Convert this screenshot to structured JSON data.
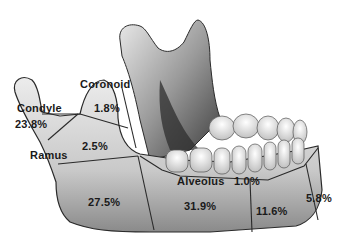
{
  "diagram": {
    "regions": [
      {
        "name": "Condyle",
        "label": "Condyle",
        "value": "23.8%"
      },
      {
        "name": "Coronoid",
        "label": "Coronoid",
        "value": "1.8%"
      },
      {
        "name": "Ramus",
        "label": "Ramus",
        "value": "2.5%"
      },
      {
        "name": "Angle",
        "label": "",
        "value": "27.5%"
      },
      {
        "name": "Body",
        "label": "",
        "value": "31.9%"
      },
      {
        "name": "Alveolus",
        "label": "Alveolus",
        "value": "1.0%"
      },
      {
        "name": "Parasymphysis",
        "label": "",
        "value": "11.6%"
      },
      {
        "name": "Symphysis",
        "label": "",
        "value": "5.8%"
      }
    ]
  },
  "colors": {
    "background": "#ffffff",
    "bone_light": "#e4e4e4",
    "bone_mid": "#b5b5b5",
    "bone_dark": "#3a3a3a",
    "divider": "#2a2a2a",
    "text": "#1a1a1a"
  }
}
